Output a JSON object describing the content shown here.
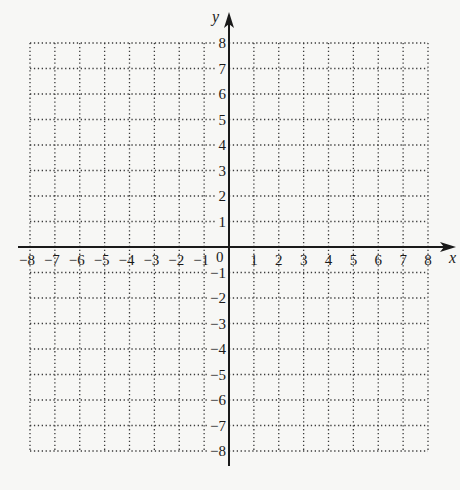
{
  "chart_data": {
    "type": "coordinate-grid",
    "title": "",
    "xlabel": "x",
    "ylabel": "y",
    "xlim": [
      -8,
      8
    ],
    "ylim": [
      -8,
      8
    ],
    "grid": "dotted",
    "x_ticks": [
      -8,
      -7,
      -6,
      -5,
      -4,
      -3,
      -2,
      -1,
      1,
      2,
      3,
      4,
      5,
      6,
      7,
      8
    ],
    "y_ticks": [
      8,
      7,
      6,
      5,
      4,
      3,
      2,
      1,
      -1,
      -2,
      -3,
      -4,
      -5,
      -6,
      -7,
      -8
    ],
    "origin_label": "0",
    "series": []
  },
  "labels": {
    "x_axis": "x",
    "y_axis": "y",
    "origin": "0"
  },
  "colors": {
    "background": "#f7f7f5",
    "axis": "#1a1a1a",
    "grid": "#3a3a3a",
    "text": "#1a1a1a"
  }
}
